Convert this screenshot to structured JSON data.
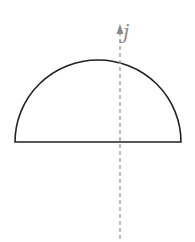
{
  "diagram": {
    "shape": "semicircle",
    "axis": {
      "label": "j",
      "style": "dashed",
      "direction": "up",
      "color": "#9a9a9a"
    },
    "outline_color": "#222222"
  }
}
